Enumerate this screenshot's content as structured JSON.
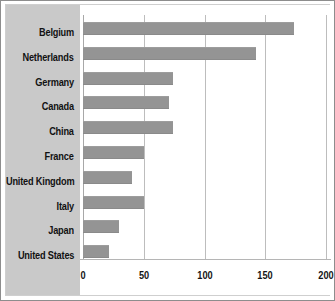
{
  "chart_data": {
    "type": "bar",
    "orientation": "horizontal",
    "title": "",
    "subtitle": "",
    "xlabel": "",
    "ylabel": "",
    "categories": [
      "Belgium",
      "Netherlands",
      "Germany",
      "Canada",
      "China",
      "France",
      "United Kingdom",
      "Italy",
      "Japan",
      "United States"
    ],
    "values": [
      174,
      142,
      74,
      71,
      74,
      50,
      40,
      50,
      30,
      21
    ],
    "series": [
      {
        "name": "",
        "values": [
          174,
          142,
          74,
          71,
          74,
          50,
          40,
          50,
          30,
          21
        ]
      }
    ],
    "xlim": [
      0,
      200
    ],
    "x_ticks": [
      0,
      50,
      100,
      150,
      200
    ],
    "x_tick_labels": [
      "0",
      "50",
      "100",
      "150",
      "200"
    ],
    "grid": true,
    "grid_axis": "x",
    "legend": false,
    "legend_position": "none",
    "bar_color": "#949494",
    "category_panel_color": "#c9c9c9",
    "plot_background": "#ffffff",
    "gridline_color": "#bdbdbd",
    "frame_color": "#8d8d8d"
  }
}
